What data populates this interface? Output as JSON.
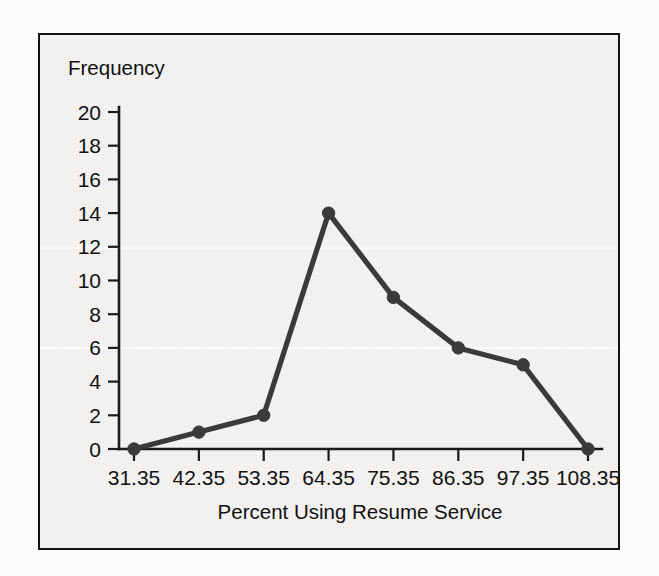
{
  "figure": {
    "background_color": "#f4f3f1",
    "frame_color": "#121212",
    "series_color": "#3a3a3a"
  },
  "chart_data": {
    "type": "line",
    "title": "",
    "subtitle": "",
    "xlabel": "Percent Using Resume Service",
    "ylabel": "Frequency",
    "categories": [
      "31.35",
      "42.35",
      "53.35",
      "64.35",
      "75.35",
      "86.35",
      "97.35",
      "108.35"
    ],
    "x": [
      31.35,
      42.35,
      53.35,
      64.35,
      75.35,
      86.35,
      97.35,
      108.35
    ],
    "values": [
      0,
      1,
      2,
      14,
      9,
      6,
      5,
      0
    ],
    "xlim": [
      31.35,
      108.35
    ],
    "ylim": [
      0,
      20
    ],
    "y_ticks": [
      0,
      2,
      4,
      6,
      8,
      10,
      12,
      14,
      16,
      18,
      20
    ],
    "y_tick_labels": [
      "0",
      "2",
      "4",
      "6",
      "8",
      "10",
      "12",
      "14",
      "16",
      "18",
      "20"
    ],
    "x_tick_labels": [
      "31.35",
      "42.35",
      "53.35",
      "64.35",
      "75.35",
      "86.35",
      "97.35",
      "108.35"
    ],
    "grid": false,
    "legend": false,
    "legend_position": "none",
    "markers": true,
    "marker_shape": "circle"
  }
}
